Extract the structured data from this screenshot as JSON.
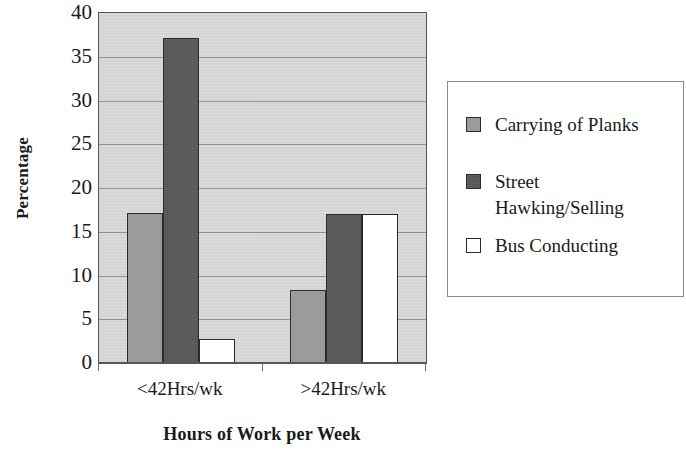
{
  "chart_data": {
    "type": "bar",
    "title": "",
    "xlabel": "Hours of Work per Week",
    "ylabel": "Percentage",
    "categories": [
      "<42Hrs/wk",
      ">42Hrs/wk"
    ],
    "series": [
      {
        "name": "Carrying of Planks",
        "values": [
          17.1,
          8.3
        ],
        "color": "#9a9a9a"
      },
      {
        "name": "Street\nHawking/Selling",
        "values": [
          37.2,
          17.0
        ],
        "color": "#555555"
      },
      {
        "name": "Bus Conducting",
        "values": [
          2.7,
          17.0
        ],
        "color": "#ffffff"
      }
    ],
    "ylim": [
      0,
      40
    ],
    "yticks": [
      0,
      5,
      10,
      15,
      20,
      25,
      30,
      35,
      40
    ],
    "ytick_labels": [
      "0",
      "5",
      "10",
      "15",
      "20",
      "25",
      "30",
      "35",
      "40"
    ],
    "grid": true,
    "grid_axis": "y",
    "legend_position": "right",
    "plot_background": "#d9d9d9",
    "legend_background": "#ffffff",
    "bar_edge_color": "#2b2b2b"
  },
  "axes": {
    "y_title": "Percentage",
    "x_title": "Hours of Work per Week"
  },
  "legend": {
    "items": [
      {
        "label": "Carrying of Planks"
      },
      {
        "label": "Street\nHawking/Selling"
      },
      {
        "label": "Bus Conducting"
      }
    ]
  }
}
